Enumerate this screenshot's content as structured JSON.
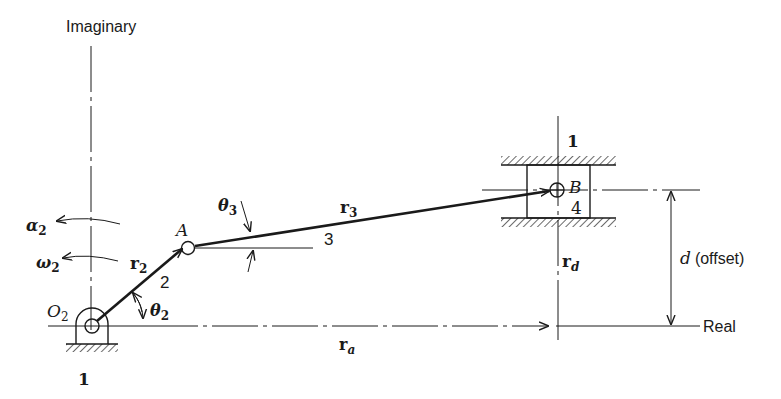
{
  "figure": {
    "axes": {
      "imaginary_label": "Imaginary",
      "real_label": "Real"
    },
    "links": {
      "ground_label_pivot": "1",
      "ground_label_slider": "1",
      "crank_number": "2",
      "coupler_number": "3",
      "slider_number": "4"
    },
    "points": {
      "O2": "O",
      "O2_sub": "2",
      "A": "A",
      "B": "B"
    },
    "vectors": {
      "r2": {
        "base": "r",
        "sub": "2"
      },
      "r3": {
        "base": "r",
        "sub": "3"
      },
      "ra": {
        "base": "r",
        "sub": "a"
      },
      "rd": {
        "base": "r",
        "sub": "d"
      }
    },
    "angles": {
      "theta2": {
        "base": "θ",
        "sub": "2"
      },
      "theta3": {
        "base": "θ",
        "sub": "3"
      }
    },
    "kinematics": {
      "alpha2": {
        "base": "α",
        "sub": "2"
      },
      "omega2": {
        "base": "ω",
        "sub": "2"
      }
    },
    "dimension": {
      "d_symbol": "d",
      "d_text": "(offset)"
    }
  }
}
